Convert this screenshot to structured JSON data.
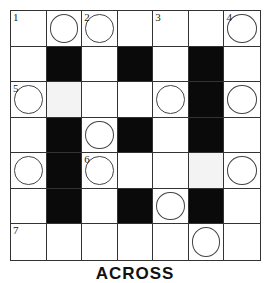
{
  "puzzle": {
    "rows": 7,
    "cols": 7,
    "colors": {
      "black": "#0a0a0a",
      "white": "#ffffff",
      "shade": "#f3f3f3",
      "line": "#333333"
    },
    "grid": [
      [
        {
          "t": "w",
          "n": "1"
        },
        {
          "t": "w",
          "c": true
        },
        {
          "t": "w",
          "c": true,
          "n": "2"
        },
        {
          "t": "w"
        },
        {
          "t": "w",
          "n": "3"
        },
        {
          "t": "w"
        },
        {
          "t": "w",
          "c": true,
          "n": "4"
        }
      ],
      [
        {
          "t": "w"
        },
        {
          "t": "b"
        },
        {
          "t": "w"
        },
        {
          "t": "b"
        },
        {
          "t": "w"
        },
        {
          "t": "b"
        },
        {
          "t": "w"
        }
      ],
      [
        {
          "t": "w",
          "c": true,
          "n": "5"
        },
        {
          "t": "s"
        },
        {
          "t": "w"
        },
        {
          "t": "w"
        },
        {
          "t": "w",
          "c": true
        },
        {
          "t": "b"
        },
        {
          "t": "w",
          "c": true
        }
      ],
      [
        {
          "t": "w"
        },
        {
          "t": "b"
        },
        {
          "t": "w",
          "c": true
        },
        {
          "t": "b"
        },
        {
          "t": "w"
        },
        {
          "t": "b"
        },
        {
          "t": "w"
        }
      ],
      [
        {
          "t": "w",
          "c": true
        },
        {
          "t": "b"
        },
        {
          "t": "w",
          "c": true,
          "n": "6"
        },
        {
          "t": "w"
        },
        {
          "t": "w"
        },
        {
          "t": "s"
        },
        {
          "t": "w",
          "c": true
        }
      ],
      [
        {
          "t": "w"
        },
        {
          "t": "b"
        },
        {
          "t": "w"
        },
        {
          "t": "b"
        },
        {
          "t": "w",
          "c": true
        },
        {
          "t": "b"
        },
        {
          "t": "w"
        }
      ],
      [
        {
          "t": "w",
          "n": "7"
        },
        {
          "t": "w"
        },
        {
          "t": "w"
        },
        {
          "t": "w"
        },
        {
          "t": "w"
        },
        {
          "t": "w",
          "c": true
        },
        {
          "t": "w"
        }
      ]
    ]
  },
  "footer": {
    "label": "ACROSS"
  }
}
